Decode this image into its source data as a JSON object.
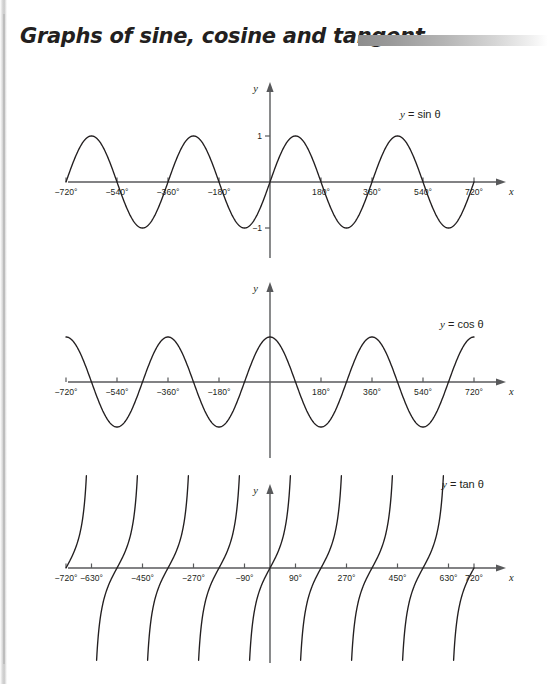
{
  "page": {
    "title": "Graphs of sine, cosine and tangent",
    "background": "#ffffff",
    "curve_color": "#231f20",
    "axis_color": "#58595b",
    "rule_color": "#8d8d8d"
  },
  "chart_data": [
    {
      "type": "line",
      "name": "sine",
      "title": "y = sin θ",
      "function": "sin",
      "xlabel": "x",
      "ylabel": "y",
      "xlim": [
        -760,
        760
      ],
      "ylim": [
        -1.45,
        1.45
      ],
      "amplitude": 1,
      "period": 360,
      "domain": [
        -720,
        720
      ],
      "grid": false,
      "xticks": [
        -720,
        -540,
        -360,
        -180,
        180,
        360,
        540,
        720
      ],
      "xticklabels": [
        "−720°",
        "−540°",
        "−360°",
        "−180°",
        "180°",
        "360°",
        "540°",
        "720°"
      ],
      "yticks": [
        1,
        -1
      ],
      "yticklabels": [
        "1",
        "−1"
      ],
      "zeros": [
        -720,
        -540,
        -360,
        -180,
        0,
        180,
        360,
        540,
        720
      ],
      "maxima": [
        -630,
        -270,
        90,
        450
      ],
      "minima": [
        -450,
        -90,
        270,
        630
      ]
    },
    {
      "type": "line",
      "name": "cosine",
      "title": "y = cos θ",
      "function": "cos",
      "xlabel": "x",
      "ylabel": "y",
      "xlim": [
        -760,
        760
      ],
      "ylim": [
        -1.45,
        1.45
      ],
      "amplitude": 1,
      "period": 360,
      "domain": [
        -720,
        720
      ],
      "grid": false,
      "xticks": [
        -720,
        -540,
        -360,
        -180,
        180,
        360,
        540,
        720
      ],
      "xticklabels": [
        "−720°",
        "−540°",
        "−360°",
        "−180°",
        "180°",
        "360°",
        "540°",
        "720°"
      ],
      "yticks": [],
      "yticklabels": [],
      "zeros": [
        -630,
        -450,
        -270,
        -90,
        90,
        270,
        450,
        630
      ],
      "maxima": [
        -720,
        -360,
        0,
        360,
        720
      ],
      "minima": [
        -540,
        -180,
        180,
        540
      ]
    },
    {
      "type": "line",
      "name": "tangent",
      "title": "y = tan θ",
      "function": "tan",
      "xlabel": "x",
      "ylabel": "y",
      "xlim": [
        -760,
        760
      ],
      "ylim": [
        -3.2,
        3.2
      ],
      "period": 180,
      "domain": [
        -720,
        720
      ],
      "grid": false,
      "xticks": [
        -720,
        -630,
        -450,
        -270,
        -90,
        90,
        270,
        450,
        630,
        720
      ],
      "xticklabels": [
        "−720°",
        "−630°",
        "−450°",
        "−270°",
        "−90°",
        "90°",
        "270°",
        "450°",
        "630°",
        "720°"
      ],
      "yticks": [],
      "yticklabels": [],
      "zeros": [
        -720,
        -540,
        -360,
        -180,
        0,
        180,
        360,
        540,
        720
      ],
      "asymptotes": [
        -630,
        -450,
        -270,
        -90,
        90,
        270,
        450,
        630
      ]
    }
  ]
}
